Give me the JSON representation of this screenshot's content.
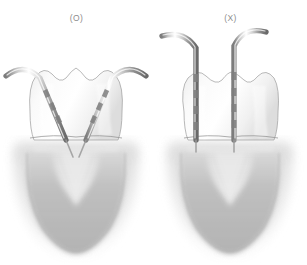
{
  "figure": {
    "background_color": "#ffffff",
    "width": 307,
    "height": 265
  },
  "panels": [
    {
      "id": "correct",
      "label": "(O)",
      "meaning": "correct",
      "probe_count": 2,
      "probe_orientation": "angled-converging",
      "probe_label_left": "periodontal-probe-left",
      "probe_label_right": "periodontal-probe-right",
      "tooth_label": "tooth-crown",
      "root_label": "tooth-root-radiograph",
      "defect_label": "interproximal-bone-defect"
    },
    {
      "id": "incorrect",
      "label": "(X)",
      "meaning": "incorrect",
      "probe_count": 2,
      "probe_orientation": "vertical-parallel",
      "probe_label_left": "periodontal-probe-left",
      "probe_label_right": "periodontal-probe-right",
      "tooth_label": "tooth-crown",
      "root_label": "tooth-root-radiograph",
      "defect_label": "interproximal-bone-defect"
    }
  ],
  "colors": {
    "background": "#ffffff",
    "label_text": "#8d8d8d",
    "crown_light": "#fbfbfb",
    "crown_mid": "#e6e6e6",
    "crown_outline": "#9a9a9a",
    "root_shadow_dark": "#9e9e9e",
    "root_shadow_mid": "#c2c2c2",
    "root_shadow_light": "#e4e4e4",
    "probe_metal_light": "#ffffff",
    "probe_metal_mid": "#b9b9b9",
    "probe_metal_dark": "#6f6f6f",
    "probe_band": "#8a8a8a"
  }
}
